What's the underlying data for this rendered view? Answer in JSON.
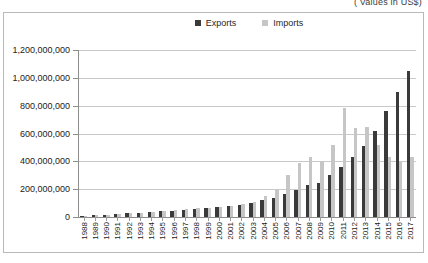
{
  "caption": "( Values in US$)",
  "legend": {
    "position": "top-center",
    "items": [
      {
        "label": "Exports",
        "color": "#3a3a3a",
        "icon": "square-swatch"
      },
      {
        "label": "Imports",
        "color": "#c6c6c6",
        "icon": "square-swatch"
      }
    ]
  },
  "chart_data": {
    "type": "bar",
    "title": "",
    "subtitle": "( Values in US$)",
    "xlabel": "",
    "ylabel": "",
    "ylim": [
      0,
      1200000000
    ],
    "ytick_labels": [
      "1,200,000,000",
      "1,000,000,000",
      "800,000,000",
      "600,000,000",
      "400,000,000",
      "200,000,000",
      "0"
    ],
    "ytick_values": [
      1200000000,
      1000000000,
      800000000,
      600000000,
      400000000,
      200000000,
      0
    ],
    "grid": true,
    "legend_position": "top-center",
    "categories": [
      "1988",
      "1989",
      "1990",
      "1991",
      "1992",
      "1993",
      "1994",
      "1995",
      "1996",
      "1997",
      "1998",
      "1999",
      "2000",
      "2001",
      "2002",
      "2003",
      "2004",
      "2005",
      "2006",
      "2007",
      "2008",
      "2009",
      "2010",
      "2011",
      "2012",
      "2013",
      "2014",
      "2015",
      "2016",
      "2017"
    ],
    "series": [
      {
        "name": "Exports",
        "color": "#3a3a3a",
        "values": [
          8000000,
          12000000,
          16000000,
          20000000,
          26000000,
          30000000,
          34000000,
          40000000,
          45000000,
          52000000,
          60000000,
          62000000,
          70000000,
          78000000,
          85000000,
          100000000,
          120000000,
          140000000,
          165000000,
          195000000,
          230000000,
          245000000,
          300000000,
          360000000,
          430000000,
          510000000,
          620000000,
          760000000,
          900000000,
          1050000000
        ]
      },
      {
        "name": "Imports",
        "color": "#c6c6c6",
        "values": [
          10000000,
          14000000,
          18000000,
          22000000,
          28000000,
          32000000,
          36000000,
          44000000,
          48000000,
          56000000,
          64000000,
          66000000,
          75000000,
          82000000,
          90000000,
          110000000,
          150000000,
          200000000,
          300000000,
          390000000,
          430000000,
          400000000,
          520000000,
          780000000,
          640000000,
          650000000,
          520000000,
          430000000,
          400000000,
          430000000
        ]
      }
    ]
  }
}
